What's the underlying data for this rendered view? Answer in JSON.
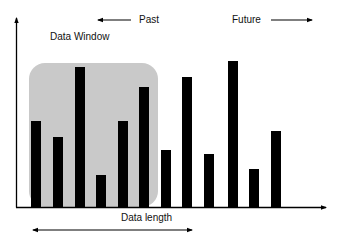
{
  "labels": {
    "data_window": "Data Window",
    "past": "Past",
    "future": "Future",
    "data_length": "Data length"
  },
  "colors": {
    "bar": "#000000",
    "window": "#c9c9c9",
    "axis": "#000000"
  },
  "bars": [
    {
      "x": 31,
      "top": 121
    },
    {
      "x": 53,
      "top": 137
    },
    {
      "x": 75,
      "top": 67
    },
    {
      "x": 96,
      "top": 175
    },
    {
      "x": 118,
      "top": 121
    },
    {
      "x": 139,
      "top": 87
    },
    {
      "x": 161,
      "top": 150
    },
    {
      "x": 182,
      "top": 77
    },
    {
      "x": 204,
      "top": 154
    },
    {
      "x": 228,
      "top": 61
    },
    {
      "x": 249,
      "top": 169
    },
    {
      "x": 271,
      "top": 131
    }
  ],
  "baseline": 207,
  "window": {
    "x": 29,
    "y": 63,
    "width": 129,
    "height": 144,
    "radius": 16
  }
}
